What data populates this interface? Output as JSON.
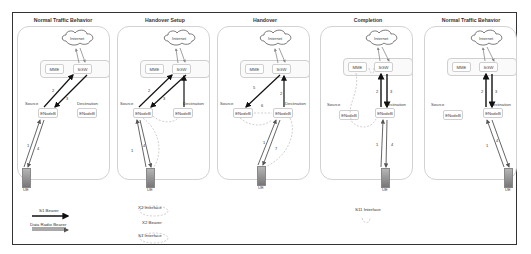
{
  "panels": [
    {
      "title": "Normal Traffic Behavior",
      "cloud": "Internet",
      "mme": "MME",
      "sgw": "SGW",
      "source_label": "Source",
      "destination_label": "Destination",
      "source_node": "ENodeB",
      "destination_node": "ENodeB",
      "ue": "UE",
      "step_numbers": [
        "1",
        "2",
        "3",
        "4"
      ]
    },
    {
      "title": "Handover Setup",
      "cloud": "Internet",
      "mme": "MME",
      "sgw": "SGW",
      "source_label": "Source",
      "destination_label": "Destination",
      "source_node": "ENodeB",
      "destination_node": "ENodeB",
      "ue": "UE",
      "step_numbers": [
        "1",
        "2",
        "3",
        "4"
      ]
    },
    {
      "title": "Handover",
      "cloud": "Internet",
      "mme": "MME",
      "sgw": "SGW",
      "source_label": "Source",
      "destination_label": "Destination",
      "source_node": "ENodeB",
      "destination_node": "ENodeB",
      "ue": "UE",
      "step_numbers": [
        "1",
        "2",
        "5",
        "6",
        "7"
      ]
    },
    {
      "title": "Completion",
      "cloud": "Internet",
      "mme": "MME",
      "sgw": "SGW",
      "source_label": "Source",
      "destination_label": "Destination",
      "source_node": "ENodeB",
      "destination_node": "ENodeB",
      "ue": "UE",
      "step_numbers": [
        "1",
        "2",
        "3",
        "4"
      ]
    },
    {
      "title": "Normal Traffic Behavior",
      "cloud": "Internet",
      "mme": "MME",
      "sgw": "SGW",
      "source_label": "Source",
      "destination_label": "Destination",
      "source_node": "ENodeB",
      "destination_node": "ENodeB",
      "ue": "UE",
      "step_numbers": [
        "1",
        "2",
        "3",
        "4"
      ]
    }
  ],
  "legend": {
    "s1_bearer": "S1 Bearer",
    "data_radio_bearer": "Data Radio Bearer",
    "x2_interface": "X2 Interface",
    "x2_bearer": "X2 Bearer",
    "s1_interface": "S1 Interface",
    "s11_interface": "S11 Interface"
  },
  "colors": {
    "bearer": "#111111",
    "radio_bearer": "#555555",
    "interface_dashed": "#b0b0b0",
    "panel_border": "#d2d2d2"
  }
}
